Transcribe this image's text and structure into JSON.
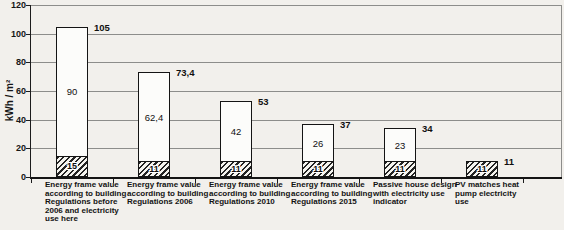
{
  "page": {
    "background": "#f2f0ec"
  },
  "chart": {
    "y_axis_title": "kWh / m²",
    "category_label_lines": [
      [
        "Energy frame value",
        "according to building",
        "Regulations before",
        "2006 and electricity",
        "use here"
      ],
      [
        "Energy frame value",
        "according to building",
        "Regulations 2006"
      ],
      [
        "Energy frame value",
        "according to building",
        "Regulations 2010"
      ],
      [
        "Energy frame value",
        "according to building",
        "Regulations 2015"
      ],
      [
        "Passive house design",
        "with electricity use",
        "indicator"
      ],
      [
        "PV matches heat",
        "pump electricity",
        "use"
      ]
    ]
  },
  "chart_data": {
    "type": "bar",
    "stacked": true,
    "title": "",
    "xlabel": "",
    "ylabel": "kWh / m²",
    "ylim": [
      0,
      120
    ],
    "ytick_step": 20,
    "y_tick_labels": [
      "0",
      "20",
      "40",
      "60",
      "80",
      "100",
      "120"
    ],
    "grid": true,
    "legend": false,
    "categories": [
      "Energy frame value according to building Regulations before 2006 and electricity use here",
      "Energy frame value according to building Regulations 2006",
      "Energy frame value according to building Regulations 2010",
      "Energy frame value according to building Regulations 2015",
      "Passive house design with electricity use indicator",
      "PV matches heat pump electricity use"
    ],
    "series": [
      {
        "name": "hatched-base-segment",
        "values": [
          15,
          11,
          11,
          11,
          11,
          11
        ],
        "labels": [
          "15",
          "11",
          "11",
          "11",
          "11",
          "11"
        ]
      },
      {
        "name": "white-upper-segment",
        "values": [
          90,
          62.4,
          42,
          26,
          23,
          0
        ],
        "labels": [
          "90",
          "62,4",
          "42",
          "26",
          "23",
          ""
        ]
      }
    ],
    "totals": [
      105,
      73.4,
      53,
      37,
      34,
      11
    ],
    "total_labels": [
      "105",
      "73,4",
      "53",
      "37",
      "34",
      "11"
    ]
  }
}
